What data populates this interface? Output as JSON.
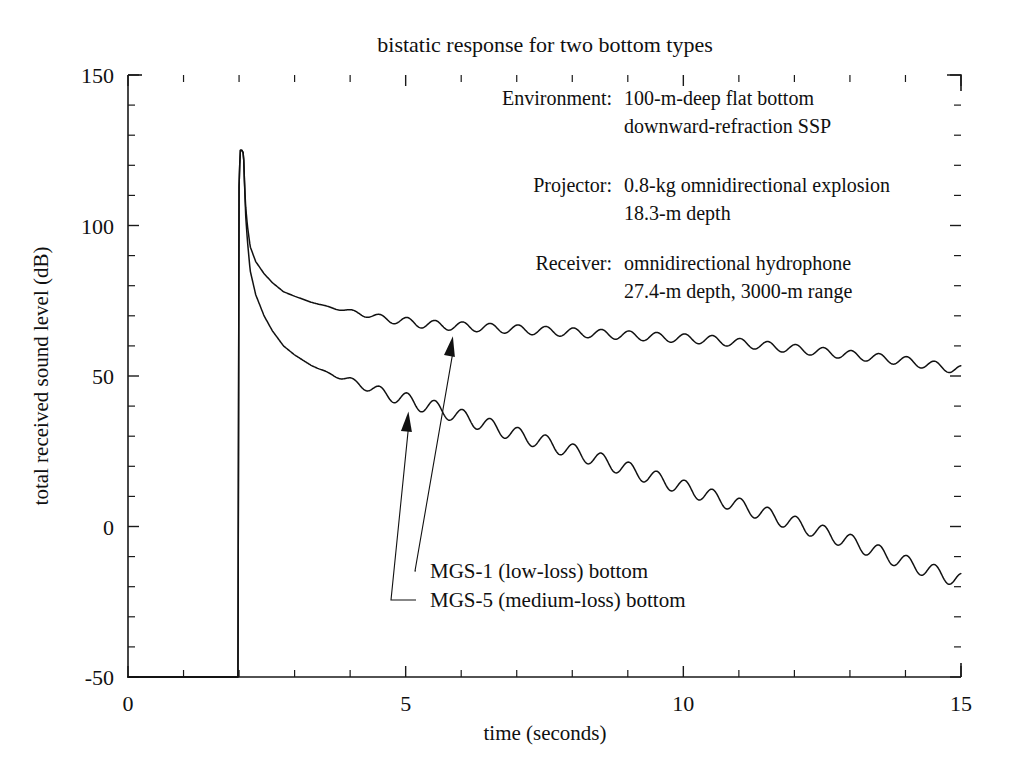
{
  "chart_data": {
    "type": "line",
    "title": "bistatic response for two bottom types",
    "xlabel": "time (seconds)",
    "ylabel": "total received sound level (dB)",
    "xlim": [
      0,
      15
    ],
    "ylim": [
      -50,
      150
    ],
    "xticks": [
      0,
      5,
      10,
      15
    ],
    "xtick_labels": [
      "0",
      "5",
      "10",
      "15"
    ],
    "xtick_minor_step": 1,
    "yticks": [
      -50,
      0,
      50,
      100,
      150
    ],
    "ytick_labels": [
      "-50",
      "0",
      "50",
      "100",
      "150"
    ],
    "ytick_minor_step": 10,
    "grid": false,
    "legend_position": "inline-annotations",
    "onset_time": 2.0,
    "peak_level": 125,
    "series": [
      {
        "name": "MGS-1 (low-loss) bottom",
        "ripple_amplitude_db": 1.5,
        "ripple_period_s": 0.5,
        "x": [
          1.98,
          2.0,
          2.02,
          2.05,
          2.08,
          2.1,
          2.12,
          2.15,
          2.2,
          2.3,
          2.45,
          2.6,
          2.8,
          3.0,
          3.3,
          3.6,
          4.0,
          4.5,
          5.0,
          5.5,
          6.0,
          6.5,
          7.0,
          7.5,
          8.0,
          8.5,
          9.0,
          9.5,
          10.0,
          10.5,
          11.0,
          11.5,
          12.0,
          12.5,
          13.0,
          13.5,
          14.0,
          14.5,
          15.0
        ],
        "y": [
          -50,
          113,
          125,
          125,
          124,
          113,
          106,
          100,
          93,
          88,
          84,
          81,
          78,
          76.5,
          74.5,
          73,
          71.5,
          69.5,
          68,
          67,
          66.5,
          66,
          65.5,
          65,
          64.5,
          64,
          63.5,
          63,
          62.5,
          62,
          61,
          60,
          59,
          58,
          57,
          56,
          55,
          53.5,
          52
        ]
      },
      {
        "name": "MGS-5 (medium-loss) bottom",
        "ripple_amplitude_db": 2.5,
        "ripple_period_s": 0.5,
        "x": [
          1.98,
          2.0,
          2.02,
          2.05,
          2.08,
          2.1,
          2.12,
          2.15,
          2.2,
          2.3,
          2.45,
          2.6,
          2.8,
          3.0,
          3.3,
          3.6,
          4.0,
          4.5,
          5.0,
          5.5,
          6.0,
          6.5,
          7.0,
          7.5,
          8.0,
          8.5,
          9.0,
          9.5,
          10.0,
          10.5,
          11.0,
          11.5,
          12.0,
          12.5,
          13.0,
          13.5,
          14.0,
          14.5,
          15.0
        ],
        "y": [
          -50,
          113,
          125,
          125,
          124,
          113,
          103,
          95,
          85,
          77,
          70,
          65,
          60,
          57,
          53.5,
          51,
          48.5,
          45,
          42,
          39.5,
          36.5,
          33.5,
          30.5,
          28,
          25,
          22,
          19,
          16,
          13,
          10,
          7,
          4,
          1,
          -2,
          -5,
          -8.5,
          -12,
          -15,
          -18
        ]
      }
    ],
    "annotations": [
      {
        "label": "Environment:",
        "lines": [
          "100-m-deep flat bottom",
          "downward-refraction SSP"
        ]
      },
      {
        "label": "Projector:",
        "lines": [
          "0.8-kg omnidirectional explosion",
          "18.3-m depth"
        ]
      },
      {
        "label": "Receiver:",
        "lines": [
          "omnidirectional hydrophone",
          "27.4-m depth,  3000-m range"
        ]
      }
    ],
    "callouts": [
      {
        "text": "MGS-1 (low-loss) bottom",
        "target_time": 5.85,
        "target_level": 64.5
      },
      {
        "text": "MGS-5 (medium-loss) bottom",
        "target_time": 5.05,
        "target_level": 39.5
      }
    ],
    "colors": {
      "line": "#111111",
      "axis": "#1a1a1a",
      "background": "#ffffff"
    }
  }
}
